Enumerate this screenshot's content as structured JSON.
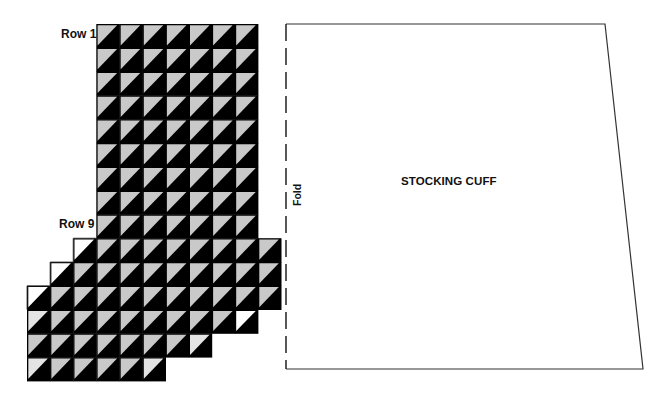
{
  "labels": {
    "row1": "Row 1",
    "row9": "Row 9",
    "cuff_title": "STOCKING CUFF",
    "fold": "Fold"
  },
  "colors": {
    "dark": "#000000",
    "light": "#c9c9c9",
    "white": "#ffffff",
    "outline": "#333333"
  },
  "grid": {
    "top": 24,
    "cell_w": 23.1,
    "cell_h": 23.8,
    "columns_origin_x": 27,
    "rows": [
      {
        "row": 1,
        "start_col": 3,
        "cells": "ggggggg"
      },
      {
        "row": 2,
        "start_col": 3,
        "cells": "ggggggg"
      },
      {
        "row": 3,
        "start_col": 3,
        "cells": "ggggggg"
      },
      {
        "row": 4,
        "start_col": 3,
        "cells": "ggggggg"
      },
      {
        "row": 5,
        "start_col": 3,
        "cells": "ggggggg"
      },
      {
        "row": 6,
        "start_col": 3,
        "cells": "ggggggg"
      },
      {
        "row": 7,
        "start_col": 3,
        "cells": "ggggggg"
      },
      {
        "row": 8,
        "start_col": 3,
        "cells": "ggggggg"
      },
      {
        "row": 9,
        "start_col": 3,
        "cells": "ggggggg"
      },
      {
        "row": 10,
        "start_col": 2,
        "cells": "wgggggggg"
      },
      {
        "row": 11,
        "start_col": 1,
        "cells": "wggggggggg"
      },
      {
        "row": 12,
        "start_col": 0,
        "cells": "wgggggggggg"
      },
      {
        "row": 13,
        "start_col": 0,
        "cells": "lggggggggw"
      },
      {
        "row": 14,
        "start_col": 0,
        "cells": "gggggggl"
      },
      {
        "row": 15,
        "start_col": 0,
        "cells": "lggggl"
      }
    ]
  },
  "cuff_pattern": {
    "top_left": [
      286,
      24
    ],
    "top_right": [
      605,
      24
    ],
    "bottom_right": [
      643,
      369
    ],
    "bottom_left": [
      286,
      369
    ],
    "fold_edge": "left",
    "fold_dash": [
      17,
      7
    ]
  }
}
